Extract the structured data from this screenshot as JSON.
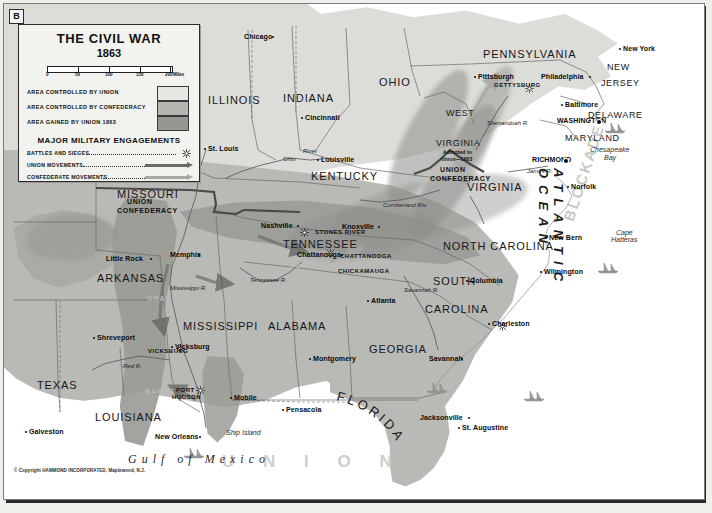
{
  "plate": {
    "letter": "B"
  },
  "legend": {
    "title": "THE CIVIL WAR",
    "subtitle": "1863",
    "scale": {
      "ticks": [
        "0",
        "50",
        "100",
        "150",
        "200"
      ],
      "units": "Miles"
    },
    "areas": [
      {
        "label": "AREA CONTROLLED BY UNION",
        "color": "#e7e7e4"
      },
      {
        "label": "AREA CONTROLLED BY CONFEDERACY",
        "color": "#b5b5b1"
      },
      {
        "label": "AREA GAINED BY UNION 1863",
        "color": "#969692"
      }
    ],
    "engagements_title": "MAJOR MILITARY ENGAGEMENTS",
    "keys": [
      {
        "label": "BATTLES AND SIEGES",
        "symbol": "sunburst"
      },
      {
        "label": "UNION MOVEMENTS",
        "symbol": "dark-arrow",
        "color": "#6a6a66"
      },
      {
        "label": "CONFEDERATE MOVEMENTS",
        "symbol": "light-arrow",
        "color": "#a8a8a4"
      }
    ]
  },
  "states": [
    {
      "name": "ILLINOIS",
      "x": 208,
      "y": 94,
      "size": "state"
    },
    {
      "name": "INDIANA",
      "x": 283,
      "y": 92,
      "size": "state"
    },
    {
      "name": "OHIO",
      "x": 379,
      "y": 76,
      "size": "state"
    },
    {
      "name": "PENNSYLVANIA",
      "x": 483,
      "y": 48,
      "size": "state"
    },
    {
      "name": "NEW",
      "x": 607,
      "y": 62,
      "size": "state-sm"
    },
    {
      "name": "JERSEY",
      "x": 601,
      "y": 78,
      "size": "state-sm"
    },
    {
      "name": "DELAWARE",
      "x": 588,
      "y": 110,
      "size": "state-sm"
    },
    {
      "name": "MARYLAND",
      "x": 565,
      "y": 133,
      "size": "state-sm"
    },
    {
      "name": "WEST",
      "x": 446,
      "y": 108,
      "size": "state-sm"
    },
    {
      "name": "VIRGINIA",
      "x": 436,
      "y": 138,
      "size": "state-sm"
    },
    {
      "name": "VIRGINIA",
      "x": 467,
      "y": 181,
      "size": "state"
    },
    {
      "name": "KENTUCKY",
      "x": 311,
      "y": 170,
      "size": "state"
    },
    {
      "name": "MISSOURI",
      "x": 117,
      "y": 188,
      "size": "state"
    },
    {
      "name": "TENNESSEE",
      "x": 283,
      "y": 238,
      "size": "state"
    },
    {
      "name": "NORTH CAROLINA",
      "x": 443,
      "y": 240,
      "size": "state"
    },
    {
      "name": "SOUTH",
      "x": 433,
      "y": 275,
      "size": "state"
    },
    {
      "name": "CAROLINA",
      "x": 425,
      "y": 303,
      "size": "state"
    },
    {
      "name": "ARKANSAS",
      "x": 97,
      "y": 272,
      "size": "state"
    },
    {
      "name": "MISSISSIPPI",
      "x": 183,
      "y": 320,
      "size": "state"
    },
    {
      "name": "ALABAMA",
      "x": 268,
      "y": 320,
      "size": "state"
    },
    {
      "name": "GEORGIA",
      "x": 369,
      "y": 343,
      "size": "state"
    },
    {
      "name": "LOUISIANA",
      "x": 95,
      "y": 411,
      "size": "state"
    },
    {
      "name": "TEXAS",
      "x": 37,
      "y": 379,
      "size": "state"
    }
  ],
  "florida_label": "FLORIDA",
  "cities": [
    {
      "name": "Chicago",
      "x": 244,
      "y": 33,
      "dot": "right"
    },
    {
      "name": "St. Louis",
      "x": 208,
      "y": 145,
      "dot": "left"
    },
    {
      "name": "Cincinnati",
      "x": 305,
      "y": 114,
      "dot": "left"
    },
    {
      "name": "Louisville",
      "x": 321,
      "y": 156,
      "dot": "left"
    },
    {
      "name": "Pittsburgh",
      "x": 478,
      "y": 73,
      "dot": "left"
    },
    {
      "name": "Philadelphia",
      "x": 541,
      "y": 73,
      "dot": "right"
    },
    {
      "name": "New York",
      "x": 623,
      "y": 45,
      "dot": "left"
    },
    {
      "name": "Baltimore",
      "x": 565,
      "y": 101,
      "dot": "left"
    },
    {
      "name": "WASHINGTON",
      "x": 557,
      "y": 117,
      "dot": "cap"
    },
    {
      "name": "RICHMOND",
      "x": 532,
      "y": 156,
      "dot": "cap"
    },
    {
      "name": "Norfolk",
      "x": 571,
      "y": 183,
      "dot": "left"
    },
    {
      "name": "New Bern",
      "x": 549,
      "y": 234,
      "dot": "left"
    },
    {
      "name": "Wilmington",
      "x": 544,
      "y": 268,
      "dot": "left"
    },
    {
      "name": "Charleston",
      "x": 492,
      "y": 320,
      "dot": "left"
    },
    {
      "name": "Columbia",
      "x": 470,
      "y": 277,
      "dot": "left"
    },
    {
      "name": "Savannah",
      "x": 429,
      "y": 355,
      "dot": "right"
    },
    {
      "name": "Nashville",
      "x": 261,
      "y": 222,
      "dot": "right"
    },
    {
      "name": "Knoxville",
      "x": 342,
      "y": 223,
      "dot": "right"
    },
    {
      "name": "Chattanooga",
      "x": 297,
      "y": 251,
      "dot": "right"
    },
    {
      "name": "Atlanta",
      "x": 371,
      "y": 297,
      "dot": "left"
    },
    {
      "name": "Montgomery",
      "x": 313,
      "y": 355,
      "dot": "left"
    },
    {
      "name": "Memphis",
      "x": 170,
      "y": 251,
      "dot": "right"
    },
    {
      "name": "Little Rock",
      "x": 106,
      "y": 255,
      "dot": "right"
    },
    {
      "name": "Vicksburg",
      "x": 175,
      "y": 343,
      "dot": "left"
    },
    {
      "name": "Shreveport",
      "x": 97,
      "y": 334,
      "dot": "left"
    },
    {
      "name": "Mobile",
      "x": 234,
      "y": 394,
      "dot": "left"
    },
    {
      "name": "Pensacola",
      "x": 286,
      "y": 406,
      "dot": "left"
    },
    {
      "name": "New Orleans",
      "x": 155,
      "y": 433,
      "dot": "right"
    },
    {
      "name": "Galveston",
      "x": 29,
      "y": 428,
      "dot": "left"
    },
    {
      "name": "Jacksonville",
      "x": 420,
      "y": 414,
      "dot": "right"
    },
    {
      "name": "St. Augustine",
      "x": 462,
      "y": 424,
      "dot": "left"
    }
  ],
  "battles": [
    {
      "name": "GETTYSBURG",
      "x": 494,
      "y": 82
    },
    {
      "name": "STONES RIVER",
      "x": 315,
      "y": 229
    },
    {
      "name": "CHATTANOOGA",
      "x": 340,
      "y": 253
    },
    {
      "name": "CHICKAMAUGA",
      "x": 338,
      "y": 268
    },
    {
      "name": "VICKSBURG",
      "x": 148,
      "y": 348
    },
    {
      "name": "PORT",
      "x": 176,
      "y": 387
    },
    {
      "name": "HUDSON",
      "x": 172,
      "y": 394
    }
  ],
  "boundary_labels": [
    {
      "top": "UNION",
      "bottom": "CONFEDERACY",
      "x": 127,
      "y": 198
    },
    {
      "top": "UNION",
      "bottom": "CONFEDERACY",
      "x": 440,
      "y": 166
    }
  ],
  "notes": [
    {
      "text": "Admitted to",
      "x": 443,
      "y": 149
    },
    {
      "text": "Union—1863",
      "x": 441,
      "y": 156
    }
  ],
  "water_labels": [
    {
      "text": "ATLANTIC OCEAN"
    },
    {
      "text": "Gulf of Mexico",
      "x": 128,
      "y": 452
    },
    {
      "text": "Chesapeake",
      "x": 590,
      "y": 146
    },
    {
      "text": "Bay",
      "x": 604,
      "y": 154
    },
    {
      "text": "Cape",
      "x": 616,
      "y": 229
    },
    {
      "text": "Hatteras",
      "x": 611,
      "y": 236
    },
    {
      "text": "Ship Island",
      "x": 226,
      "y": 429
    }
  ],
  "rivers": [
    {
      "name": "Ohio",
      "x": 283,
      "y": 156
    },
    {
      "name": "River",
      "x": 303,
      "y": 148
    },
    {
      "name": "Mississippi R.",
      "x": 170,
      "y": 285
    },
    {
      "name": "Tennessee R.",
      "x": 250,
      "y": 277
    },
    {
      "name": "Cumberland Riv.",
      "x": 383,
      "y": 202
    },
    {
      "name": "Shenandoah R.",
      "x": 487,
      "y": 120
    },
    {
      "name": "James R.",
      "x": 527,
      "y": 168
    },
    {
      "name": "Red R.",
      "x": 123,
      "y": 363
    },
    {
      "name": "Savannah R.",
      "x": 404,
      "y": 287
    }
  ],
  "movements": [
    {
      "name": "GRANT",
      "x": 147,
      "y": 295
    },
    {
      "name": "ROSECRANS",
      "x": 289,
      "y": 262
    },
    {
      "name": "BANKS",
      "x": 145,
      "y": 388
    }
  ],
  "blockade_word": "BLOCKADE",
  "union_word": "U N I O N",
  "ocean_word": "ATLANTIC OCEAN",
  "copyright": "© Copyright HAMMOND INCORPORATED, Maplewood, N.J."
}
